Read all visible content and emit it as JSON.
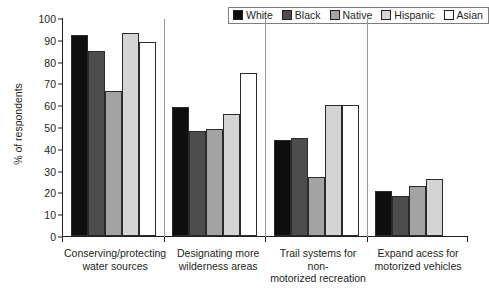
{
  "chart_data": {
    "type": "bar",
    "title": "",
    "xlabel": "",
    "ylabel": "% of respondents",
    "ylim": [
      0,
      100
    ],
    "yticks": [
      0,
      10,
      20,
      30,
      40,
      50,
      60,
      70,
      80,
      90,
      100
    ],
    "grid": false,
    "legend_position": "top-right",
    "categories": [
      "Conserving/protecting water sources",
      "Designating more wilderness areas",
      "Trail systems for non-motorized recreation",
      "Expand acess for motorized vehicles"
    ],
    "category_lines": [
      [
        "Conserving/protecting",
        "water sources"
      ],
      [
        "Designating more",
        "wilderness areas"
      ],
      [
        "Trail systems for non-",
        "motorized recreation"
      ],
      [
        "Expand acess for",
        "motorized vehicles"
      ]
    ],
    "series": [
      {
        "name": "White",
        "color": "#100d0d",
        "values": [
          92,
          59,
          44,
          20.5
        ]
      },
      {
        "name": "Black",
        "color": "#4d4d4d",
        "values": [
          85,
          48,
          45,
          18.5
        ]
      },
      {
        "name": "Native",
        "color": "#a3a3a3",
        "values": [
          66.5,
          49,
          27,
          23
        ]
      },
      {
        "name": "Hispanic",
        "color": "#d4d4d4",
        "values": [
          93,
          56,
          60,
          26
        ]
      },
      {
        "name": "Asian",
        "color": "#ffffff",
        "values": [
          89,
          75,
          60,
          null
        ]
      }
    ]
  }
}
